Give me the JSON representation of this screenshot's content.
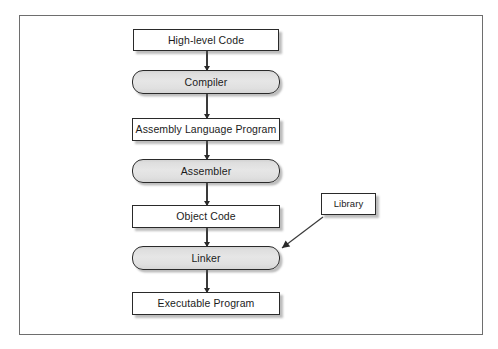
{
  "diagram": {
    "frame": {
      "border_color": "#6e6e6e",
      "background": "#ffffff"
    },
    "style": {
      "data_node_fill": "#ffffff",
      "process_node_fill": "#e2e2e2",
      "node_border_color": "#2a2a2a",
      "arrow_color": "#2a2a2a"
    },
    "nodes": [
      {
        "id": "high-level-code",
        "label": "High-level Code",
        "shape": "rect",
        "x": 132,
        "y": 28,
        "w": 146,
        "h": 22
      },
      {
        "id": "compiler",
        "label": "Compiler",
        "shape": "round",
        "x": 131,
        "y": 69,
        "w": 148,
        "h": 24
      },
      {
        "id": "assembly-language-program",
        "label": "Assembly Language Program",
        "shape": "rect",
        "x": 131,
        "y": 117,
        "w": 148,
        "h": 23
      },
      {
        "id": "assembler",
        "label": "Assembler",
        "shape": "round",
        "x": 131,
        "y": 158,
        "w": 148,
        "h": 24
      },
      {
        "id": "object-code",
        "label": "Object Code",
        "shape": "rect",
        "x": 131,
        "y": 204,
        "w": 148,
        "h": 23
      },
      {
        "id": "linker",
        "label": "Linker",
        "shape": "round",
        "x": 131,
        "y": 245,
        "w": 148,
        "h": 24
      },
      {
        "id": "executable-program",
        "label": "Executable Program",
        "shape": "rect",
        "x": 131,
        "y": 291,
        "w": 148,
        "h": 23
      },
      {
        "id": "library",
        "label": "Library",
        "shape": "rect",
        "x": 320,
        "y": 192,
        "w": 55,
        "h": 22
      }
    ],
    "edges": [
      {
        "id": "high-level-code-to-compiler",
        "from": "high-level-code",
        "to": "compiler",
        "kind": "vertical"
      },
      {
        "id": "compiler-to-assembly-language-program",
        "from": "compiler",
        "to": "assembly-language-program",
        "kind": "vertical"
      },
      {
        "id": "assembly-language-program-to-assembler",
        "from": "assembly-language-program",
        "to": "assembler",
        "kind": "vertical"
      },
      {
        "id": "assembler-to-object-code",
        "from": "assembler",
        "to": "object-code",
        "kind": "vertical"
      },
      {
        "id": "object-code-to-linker",
        "from": "object-code",
        "to": "linker",
        "kind": "vertical"
      },
      {
        "id": "linker-to-executable-program",
        "from": "linker",
        "to": "executable-program",
        "kind": "vertical"
      },
      {
        "id": "library-to-linker",
        "from": "library",
        "to": "linker",
        "kind": "diagonal"
      }
    ]
  }
}
